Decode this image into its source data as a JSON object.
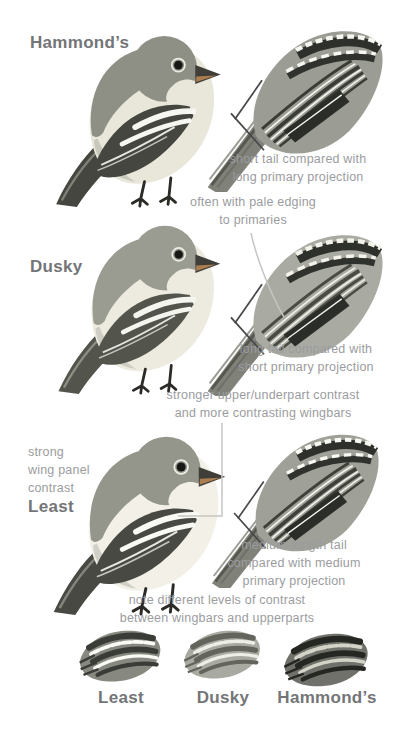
{
  "colors": {
    "background": "#ffffff",
    "species_label": "#737577",
    "annotation_text": "#9b9ca0",
    "leader_line": "#c5c6c2"
  },
  "sections": [
    {
      "species": "Hammond’s",
      "wing_note": "short tail compared with\nlong primary projection"
    },
    {
      "species": "Dusky",
      "primaries_note": "often with pale edging\nto primaries",
      "wing_note": "long tail compared with\nshort primary projection"
    },
    {
      "species": "Least",
      "contrast_note": "stronger upper/underpart contrast\nand more contrasting wingbars",
      "wing_panel_note": "strong\nwing panel\ncontrast",
      "wing_note": "medium-length tail\ncompared with medium\nprimary projection"
    }
  ],
  "comparison": {
    "note": "note different levels of contrast\nbetween wingbars and upperparts",
    "wings": [
      {
        "label": "Least"
      },
      {
        "label": "Dusky"
      },
      {
        "label": "Hammond’s"
      }
    ]
  }
}
